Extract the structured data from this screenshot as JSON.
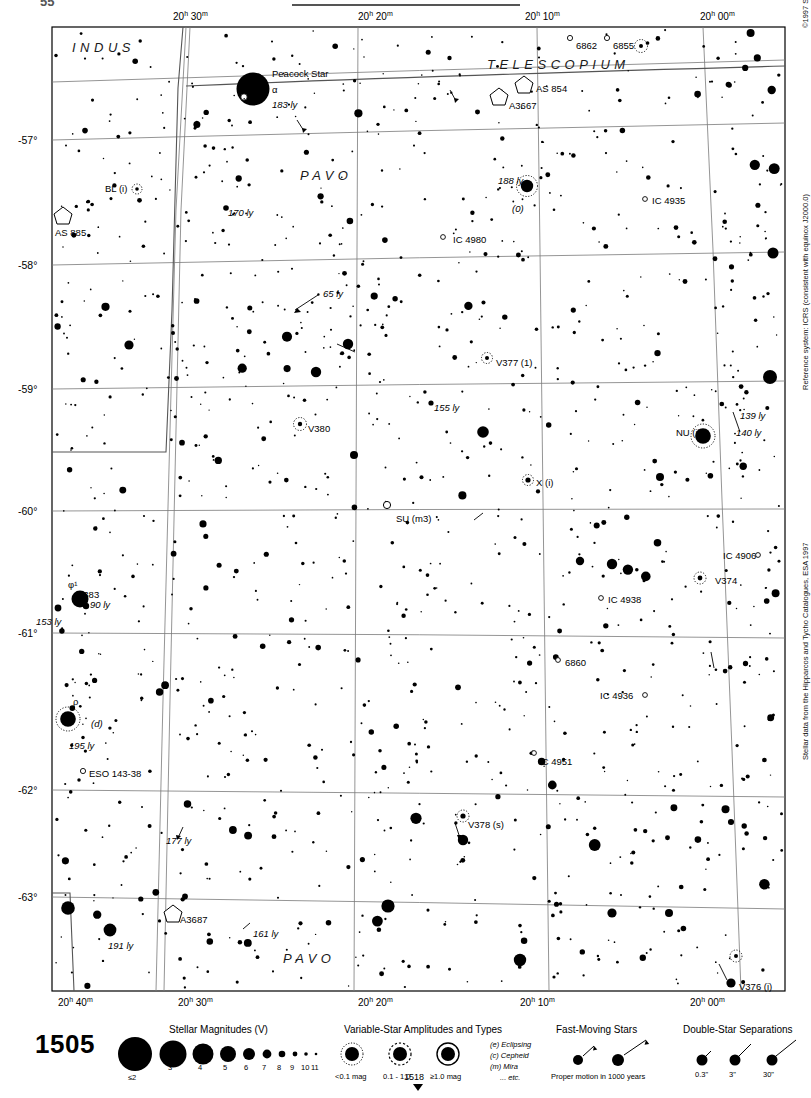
{
  "chart": {
    "number": "1505",
    "bottom_pointer_number": "1518",
    "top_partial_number": "55",
    "copyright": "©1997 Sky Publishing Corporation",
    "reference_system": "Reference system: ICRS (consistent with equinox J2000.0)",
    "data_source": "Stellar data from the Hipparcos and Tycho Catalogues, ESA 1997"
  },
  "axes": {
    "ra_top": [
      "20h 30m",
      "20h 20m",
      "20h 10m",
      "20h 00m"
    ],
    "ra_bottom": [
      "20h 40m",
      "20h 30m",
      "20h 20m",
      "20h 10m",
      "20h 00m"
    ],
    "dec_left": [
      "-57°",
      "-58°",
      "-59°",
      "-60°",
      "-61°",
      "-62°",
      "-63°"
    ]
  },
  "constellations": [
    {
      "name": "INDUS",
      "x": 72,
      "y": 40
    },
    {
      "name": "TELESCOPIUM",
      "x": 487,
      "y": 57
    },
    {
      "name": "PAVO",
      "x": 300,
      "y": 168
    },
    {
      "name": "PAVO",
      "x": 283,
      "y": 951
    }
  ],
  "labels": [
    {
      "text": "Peacock Star",
      "x": 272,
      "y": 69,
      "style": "plain"
    },
    {
      "text": "α",
      "x": 272,
      "y": 85,
      "style": "plain"
    },
    {
      "text": "183 ly",
      "x": 272,
      "y": 100,
      "style": "ital"
    },
    {
      "text": "6862",
      "x": 576,
      "y": 41,
      "style": "plain"
    },
    {
      "text": "6855",
      "x": 613,
      "y": 41,
      "style": "plain"
    },
    {
      "text": "AS 854",
      "x": 536,
      "y": 84,
      "style": "plain"
    },
    {
      "text": "A3667",
      "x": 509,
      "y": 101,
      "style": "plain"
    },
    {
      "text": "BL (i)",
      "x": 105,
      "y": 184,
      "style": "plain"
    },
    {
      "text": "AS 885",
      "x": 55,
      "y": 228,
      "style": "plain"
    },
    {
      "text": "170 ly",
      "x": 228,
      "y": 208,
      "style": "ital"
    },
    {
      "text": "188 ly",
      "x": 498,
      "y": 176,
      "style": "ital"
    },
    {
      "text": "(0)",
      "x": 512,
      "y": 204,
      "style": "ital"
    },
    {
      "text": "IC 4935",
      "x": 652,
      "y": 196,
      "style": "plain"
    },
    {
      "text": "IC 4980",
      "x": 453,
      "y": 235,
      "style": "plain"
    },
    {
      "text": "65 ly",
      "x": 323,
      "y": 289,
      "style": "ital"
    },
    {
      "text": "V377 (1)",
      "x": 496,
      "y": 358,
      "style": "plain"
    },
    {
      "text": "155 ly",
      "x": 434,
      "y": 403,
      "style": "ital"
    },
    {
      "text": "V380",
      "x": 308,
      "y": 424,
      "style": "plain"
    },
    {
      "text": "NU (i)",
      "x": 676,
      "y": 428,
      "style": "plain"
    },
    {
      "text": "139 ly",
      "x": 740,
      "y": 411,
      "style": "ital"
    },
    {
      "text": "140 ly",
      "x": 736,
      "y": 428,
      "style": "ital"
    },
    {
      "text": "X (i)",
      "x": 536,
      "y": 478,
      "style": "plain"
    },
    {
      "text": "V383",
      "x": 77,
      "y": 590,
      "style": "plain"
    },
    {
      "text": "SU (m3)",
      "x": 396,
      "y": 514,
      "style": "plain"
    },
    {
      "text": "IC 4938",
      "x": 608,
      "y": 595,
      "style": "plain"
    },
    {
      "text": "IC 4906",
      "x": 723,
      "y": 551,
      "style": "plain"
    },
    {
      "text": "V374",
      "x": 715,
      "y": 576,
      "style": "plain"
    },
    {
      "text": "φ¹",
      "x": 68,
      "y": 580,
      "style": "plain"
    },
    {
      "text": "90 ly",
      "x": 90,
      "y": 600,
      "style": "ital"
    },
    {
      "text": "153 ly",
      "x": 36,
      "y": 617,
      "style": "ital"
    },
    {
      "text": "6860",
      "x": 565,
      "y": 658,
      "style": "plain"
    },
    {
      "text": "IC 4936",
      "x": 600,
      "y": 691,
      "style": "plain"
    },
    {
      "text": "ρ",
      "x": 73,
      "y": 697,
      "style": "plain"
    },
    {
      "text": "(d)",
      "x": 91,
      "y": 719,
      "style": "ital"
    },
    {
      "text": "195 ly",
      "x": 69,
      "y": 741,
      "style": "ital"
    },
    {
      "text": "IC 4951",
      "x": 539,
      "y": 757,
      "style": "plain"
    },
    {
      "text": "ESO 143-38",
      "x": 89,
      "y": 769,
      "style": "plain"
    },
    {
      "text": "V378 (s)",
      "x": 468,
      "y": 820,
      "style": "plain"
    },
    {
      "text": "177 ly",
      "x": 166,
      "y": 836,
      "style": "ital"
    },
    {
      "text": "A3687",
      "x": 180,
      "y": 915,
      "style": "plain"
    },
    {
      "text": "161 ly",
      "x": 253,
      "y": 929,
      "style": "ital"
    },
    {
      "text": "191 ly",
      "x": 108,
      "y": 941,
      "style": "ital"
    },
    {
      "text": "V376 (i)",
      "x": 739,
      "y": 982,
      "style": "plain"
    }
  ],
  "legend": {
    "magnitudes": {
      "title": "Stellar Magnitudes (V)",
      "labels": [
        "≤2",
        "3",
        "4",
        "5",
        "6",
        "7",
        "8",
        "9",
        "10",
        "11"
      ]
    },
    "variables": {
      "title": "Variable-Star Amplitudes and Types",
      "amplitudes": [
        "<0.1 mag",
        "0.1 - 1.0",
        "≥1.0 mag"
      ],
      "types": [
        "(e)  Eclipsing",
        "(c)  Cepheid",
        "(m)  Mira",
        "... etc."
      ]
    },
    "fast_moving": {
      "title": "Fast-Moving Stars",
      "caption": "Proper motion in 1000 years"
    },
    "doubles": {
      "title": "Double-Star Separations",
      "labels": [
        "0.3\"",
        "3\"",
        "30\""
      ]
    }
  },
  "chart_data": {
    "type": "scatter",
    "xlabel": "Right Ascension",
    "ylabel": "Declination",
    "xlim": [
      "20h 42m",
      "19h 58m"
    ],
    "ylim": [
      -63.4,
      -56.4
    ],
    "grid": true,
    "stars": [
      {
        "x": 253,
        "y": 89,
        "mag": 1.9,
        "name": "Peacock Star α Pav",
        "dist_ly": 183
      },
      {
        "x": 527,
        "y": 186,
        "mag": 4.2,
        "name": "λ Pav",
        "dist_ly": 188,
        "variable": true
      },
      {
        "x": 703,
        "y": 436,
        "mag": 4.9,
        "name": "NU Pav",
        "variable": true
      },
      {
        "x": 80,
        "y": 599,
        "mag": 4.8,
        "name": "φ¹ Pav",
        "dist_ly": 90
      },
      {
        "x": 68,
        "y": 719,
        "mag": 4.9,
        "name": "ρ Pav",
        "dist_ly": 195,
        "variable": true
      },
      {
        "x": 300,
        "y": 424,
        "mag": 6.5,
        "name": "V380 Pav",
        "variable": true
      },
      {
        "x": 487,
        "y": 358,
        "mag": 7.0,
        "name": "V377 Pav",
        "variable": true
      },
      {
        "x": 528,
        "y": 480,
        "mag": 7.5,
        "name": "X Pav",
        "variable": true
      },
      {
        "x": 700,
        "y": 578,
        "mag": 7.5,
        "name": "V374 Pav",
        "variable": true
      },
      {
        "x": 463,
        "y": 816,
        "mag": 7.0,
        "name": "V378 Pav",
        "variable": true
      },
      {
        "x": 731,
        "y": 983,
        "mag": 6.8,
        "name": "V376 Pav",
        "variable": true
      },
      {
        "x": 137,
        "y": 189,
        "mag": 8.0,
        "name": "BL Pav",
        "variable": true
      },
      {
        "x": 387,
        "y": 505,
        "mag": 9.5,
        "name": "SU Pav",
        "variable": true
      }
    ],
    "deep_sky": [
      {
        "label": "6862",
        "x": 570,
        "y": 36,
        "type": "galaxy"
      },
      {
        "label": "6855",
        "x": 607,
        "y": 36,
        "type": "galaxy"
      },
      {
        "label": "AS 854",
        "x": 524,
        "y": 84,
        "type": "cluster"
      },
      {
        "label": "A3667",
        "x": 500,
        "y": 95,
        "type": "cluster"
      },
      {
        "label": "AS 885",
        "x": 63,
        "y": 215,
        "type": "cluster"
      },
      {
        "label": "IC 4935",
        "x": 645,
        "y": 199,
        "type": "galaxy"
      },
      {
        "label": "IC 4980",
        "x": 443,
        "y": 237,
        "type": "galaxy"
      },
      {
        "label": "IC 4938",
        "x": 601,
        "y": 598,
        "type": "galaxy"
      },
      {
        "label": "IC 4906",
        "x": 758,
        "y": 555,
        "type": "galaxy"
      },
      {
        "label": "6860",
        "x": 558,
        "y": 660,
        "type": "galaxy"
      },
      {
        "label": "IC 4936",
        "x": 645,
        "y": 695,
        "type": "galaxy"
      },
      {
        "label": "IC 4951",
        "x": 534,
        "y": 753,
        "type": "galaxy"
      },
      {
        "label": "ESO 143-38",
        "x": 83,
        "y": 771,
        "type": "galaxy"
      },
      {
        "label": "A3687",
        "x": 173,
        "y": 913,
        "type": "cluster"
      }
    ]
  }
}
